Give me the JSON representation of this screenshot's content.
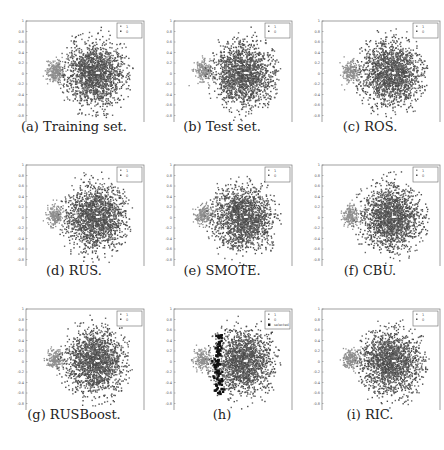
{
  "figure": {
    "panels": [
      {
        "id": "a",
        "caption": "(a) Training set.",
        "legend": [
          "1",
          "0"
        ]
      },
      {
        "id": "b",
        "caption": "(b) Test set.",
        "legend": [
          "1",
          "0"
        ]
      },
      {
        "id": "c",
        "caption": "(c) ROS.",
        "legend": [
          "1",
          "0"
        ]
      },
      {
        "id": "d",
        "caption": "(d) RUS.",
        "legend": [
          "1",
          "0"
        ]
      },
      {
        "id": "e",
        "caption": "(e) SMOTE.",
        "legend": [
          "1",
          "0"
        ]
      },
      {
        "id": "f",
        "caption": "(f) CBU.",
        "legend": [
          "1",
          "0"
        ]
      },
      {
        "id": "g",
        "caption": "(g) RUSBoost.",
        "legend": [
          "1",
          "0"
        ]
      },
      {
        "id": "h",
        "caption": "(h)",
        "legend": [
          "1",
          "0",
          "selected"
        ]
      },
      {
        "id": "i",
        "caption": "(i) RIC.",
        "legend": [
          "1",
          "0"
        ]
      }
    ]
  },
  "chart_data": [
    {
      "type": "scatter",
      "panel": "a",
      "title": "(a) Training set.",
      "xlim": [
        2.5,
        5
      ],
      "ylim": [
        -1,
        1
      ],
      "xticks": [
        "2.5",
        "3",
        "3.5",
        "4",
        "4.5",
        "5"
      ],
      "yticks": [
        "1",
        "0.8",
        "0.6",
        "0.4",
        "0.2",
        "0",
        "-0.2",
        "-0.4",
        "-0.6",
        "-0.8",
        "-1"
      ],
      "series": [
        {
          "name": "minority",
          "color": "#8e8e8e",
          "center": [
            3.1,
            0.05
          ],
          "spread": [
            0.12,
            0.1
          ]
        },
        {
          "name": "majority",
          "color": "#4f4f4f",
          "center": [
            3.95,
            0.0
          ],
          "spread": [
            0.45,
            0.42
          ]
        }
      ],
      "legend_position": "upper right"
    },
    {
      "type": "scatter",
      "panel": "b",
      "title": "(b) Test set.",
      "xlim": [
        2.5,
        5
      ],
      "ylim": [
        -1,
        1
      ],
      "series": [
        {
          "name": "minority",
          "color": "#8e8e8e",
          "center": [
            3.1,
            0.0
          ]
        },
        {
          "name": "majority",
          "color": "#4f4f4f",
          "center": [
            3.95,
            0.0
          ]
        }
      ]
    },
    {
      "type": "scatter",
      "panel": "c",
      "title": "(c) ROS.",
      "xlim": [
        2.5,
        5
      ],
      "ylim": [
        -1,
        1
      ],
      "series": [
        {
          "name": "minority",
          "color": "#8e8e8e",
          "center": [
            3.1,
            0.0
          ]
        },
        {
          "name": "majority",
          "color": "#4f4f4f",
          "center": [
            3.95,
            0.0
          ]
        }
      ]
    },
    {
      "type": "scatter",
      "panel": "d",
      "title": "(d) RUS.",
      "xlim": [
        2.5,
        5
      ],
      "ylim": [
        -1,
        1
      ],
      "series": [
        {
          "name": "minority",
          "color": "#8e8e8e",
          "center": [
            3.1,
            0.0
          ]
        },
        {
          "name": "majority",
          "color": "#4f4f4f",
          "center": [
            3.95,
            0.0
          ]
        }
      ]
    },
    {
      "type": "scatter",
      "panel": "e",
      "title": "(e) SMOTE.",
      "xlim": [
        2.5,
        5
      ],
      "ylim": [
        -1,
        1
      ],
      "series": [
        {
          "name": "minority",
          "color": "#8e8e8e",
          "center": [
            3.1,
            0.0
          ]
        },
        {
          "name": "majority",
          "color": "#4f4f4f",
          "center": [
            3.95,
            0.0
          ]
        }
      ]
    },
    {
      "type": "scatter",
      "panel": "f",
      "title": "(f) CBU.",
      "xlim": [
        2.5,
        5
      ],
      "ylim": [
        -1,
        1
      ],
      "series": [
        {
          "name": "minority",
          "color": "#8e8e8e",
          "center": [
            3.1,
            0.0
          ]
        },
        {
          "name": "majority",
          "color": "#4f4f4f",
          "center": [
            3.95,
            0.0
          ]
        }
      ]
    },
    {
      "type": "scatter",
      "panel": "g",
      "title": "(g) RUSBoost.",
      "xlim": [
        2.5,
        5
      ],
      "ylim": [
        -1,
        1
      ],
      "series": [
        {
          "name": "minority",
          "color": "#8e8e8e",
          "center": [
            3.1,
            0.0
          ]
        },
        {
          "name": "majority",
          "color": "#4f4f4f",
          "center": [
            3.95,
            0.0
          ]
        }
      ]
    },
    {
      "type": "scatter",
      "panel": "h",
      "title": "(h)",
      "xlim": [
        2.5,
        5
      ],
      "ylim": [
        -1,
        1
      ],
      "series": [
        {
          "name": "minority",
          "color": "#8e8e8e",
          "center": [
            3.1,
            0.0
          ]
        },
        {
          "name": "majority",
          "color": "#4f4f4f",
          "center": [
            3.95,
            0.0
          ]
        },
        {
          "name": "selected",
          "color": "#111111",
          "marker": "filled-square",
          "band_x": [
            3.3,
            3.5
          ],
          "band_y": [
            -0.6,
            0.6
          ]
        }
      ]
    },
    {
      "type": "scatter",
      "panel": "i",
      "title": "(i) RIC.",
      "xlim": [
        2.5,
        5
      ],
      "ylim": [
        -1,
        1
      ],
      "series": [
        {
          "name": "minority",
          "color": "#8e8e8e",
          "center": [
            3.1,
            0.0
          ]
        },
        {
          "name": "majority",
          "color": "#4f4f4f",
          "center": [
            3.95,
            0.0
          ]
        }
      ]
    }
  ]
}
